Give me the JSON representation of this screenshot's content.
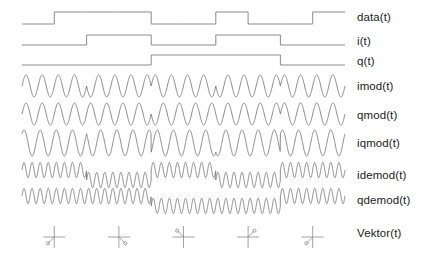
{
  "figure": {
    "background_color": "#ffffff",
    "trace_color": "#6e6e6e",
    "label_color": "#1b1b1b"
  },
  "labels": {
    "data": "data(t)",
    "i": "i(t)",
    "q": "q(t)",
    "imod": "imod(t)",
    "qmod": "qmod(t)",
    "iqmod": "iqmod(t)",
    "idemod": "idemod(t)",
    "qdemod": "qdemod(t)",
    "vektor": "Vektor(t)"
  },
  "chart_data": {
    "type": "line",
    "xlabel": "",
    "ylabel": "",
    "grid": false,
    "legend_position": "right",
    "x_range": [
      0,
      1
    ],
    "time_axis": {
      "start_px": 22,
      "end_px": 345,
      "symbol_count": 5
    },
    "series": [
      {
        "name": "data(t)",
        "kind": "digital",
        "levels": [
          0,
          1,
          1,
          1,
          0,
          0,
          1,
          0,
          0,
          1
        ],
        "bit_edges": [
          0.0,
          0.1,
          0.2,
          0.3,
          0.4,
          0.5,
          0.6,
          0.7,
          0.8,
          0.9,
          1.0
        ],
        "description": "Serial input bit stream"
      },
      {
        "name": "i(t)",
        "kind": "digital",
        "levels": [
          0,
          1,
          0,
          1,
          0
        ],
        "bit_edges": [
          0.0,
          0.2,
          0.4,
          0.6,
          0.8,
          1.0
        ],
        "description": "In-phase branch, odd bits held for one symbol"
      },
      {
        "name": "q(t)",
        "kind": "digital",
        "levels": [
          0,
          0,
          1,
          1,
          0
        ],
        "bit_edges": [
          0.0,
          0.2,
          0.4,
          0.6,
          0.8,
          1.0
        ],
        "description": "Quadrature branch, even bits held for one symbol"
      },
      {
        "name": "imod(t)",
        "kind": "sine",
        "cycles": 20,
        "phase_per_symbol_deg": [
          0,
          180,
          0,
          180,
          0
        ],
        "description": "I carrier BPSK modulated by i(t)"
      },
      {
        "name": "qmod(t)",
        "kind": "sine",
        "cycles": 20,
        "phase_per_symbol_deg": [
          0,
          0,
          180,
          180,
          0
        ],
        "description": "Q carrier BPSK modulated by q(t)"
      },
      {
        "name": "iqmod(t)",
        "kind": "sine",
        "cycles": 20,
        "phase_per_symbol_deg": [
          45,
          135,
          315,
          225,
          45
        ],
        "description": "Sum of imod and qmod: QPSK signal"
      },
      {
        "name": "idemod(t)",
        "kind": "sine",
        "cycles": 40,
        "offset_per_symbol": [
          0.55,
          -0.55,
          0.55,
          -0.55,
          0.55
        ],
        "description": "I branch after mixing with recovered carrier"
      },
      {
        "name": "qdemod(t)",
        "kind": "sine",
        "cycles": 40,
        "offset_per_symbol": [
          0.55,
          0.55,
          -0.55,
          -0.55,
          0.55
        ],
        "description": "Q branch after mixing with recovered carrier"
      },
      {
        "name": "Vektor(t)",
        "kind": "constellation",
        "symbols": [
          {
            "index": 1,
            "angle_deg": 225,
            "quadrant": "lower-left",
            "bits": "00"
          },
          {
            "index": 2,
            "angle_deg": 315,
            "quadrant": "lower-right",
            "bits": "10"
          },
          {
            "index": 3,
            "angle_deg": 135,
            "quadrant": "upper-left",
            "bits": "01"
          },
          {
            "index": 4,
            "angle_deg": 45,
            "quadrant": "upper-right",
            "bits": "11"
          },
          {
            "index": 5,
            "angle_deg": 225,
            "quadrant": "lower-left",
            "bits": "00"
          }
        ],
        "description": "Instantaneous phasor per symbol shown on I/Q axes"
      }
    ]
  }
}
